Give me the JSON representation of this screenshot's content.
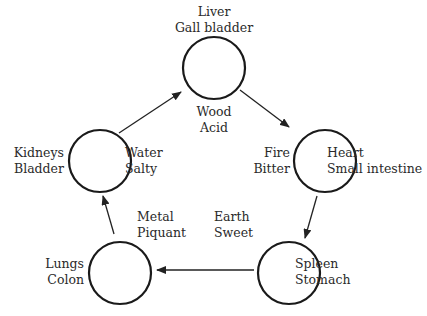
{
  "diagram": {
    "type": "five-elements-cycle",
    "nodes": [
      {
        "element": "Wood",
        "taste": "Acid",
        "organs": [
          "Liver",
          "Gall bladder"
        ]
      },
      {
        "element": "Fire",
        "taste": "Bitter",
        "organs": [
          "Heart",
          "Small intestine"
        ]
      },
      {
        "element": "Earth",
        "taste": "Sweet",
        "organs": [
          "Spleen",
          "Stomach"
        ]
      },
      {
        "element": "Metal",
        "taste": "Piquant",
        "organs": [
          "Lungs",
          "Colon"
        ]
      },
      {
        "element": "Water",
        "taste": "Salty",
        "organs": [
          "Kidneys",
          "Bladder"
        ]
      }
    ],
    "edges": [
      {
        "from": "Wood",
        "to": "Fire"
      },
      {
        "from": "Fire",
        "to": "Earth"
      },
      {
        "from": "Earth",
        "to": "Metal"
      },
      {
        "from": "Metal",
        "to": "Water"
      },
      {
        "from": "Water",
        "to": "Wood"
      }
    ]
  }
}
